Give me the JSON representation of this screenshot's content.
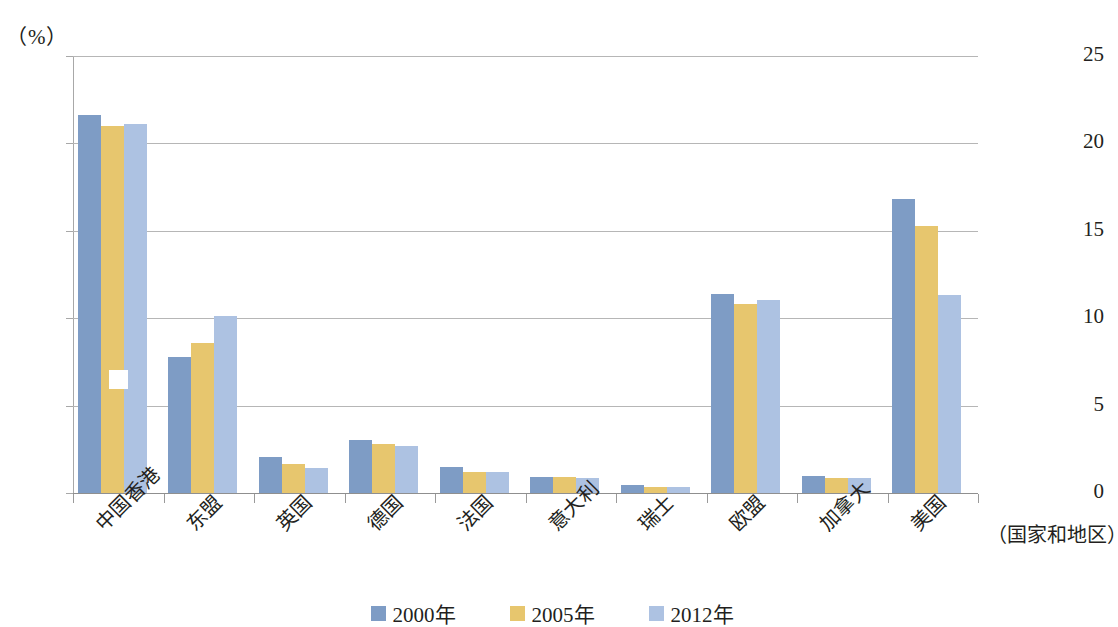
{
  "chart_data": {
    "type": "bar",
    "title": "",
    "subtitle": "",
    "unit_label": "（%）",
    "xlabel": "（国家和地区）",
    "ylabel": "",
    "ylim": [
      0,
      25
    ],
    "ytick_labels": [
      "25",
      "20",
      "15",
      "10",
      "5",
      "0"
    ],
    "ytick_values": [
      25,
      20,
      15,
      10,
      5,
      0
    ],
    "grid": true,
    "legend_position": "bottom",
    "categories": [
      "中国香港",
      "东盟",
      "英国",
      "德国",
      "法国",
      "意大利",
      "瑞士",
      "欧盟",
      "加拿大",
      "美国"
    ],
    "series": [
      {
        "name": "2000年",
        "color": "#7e9cc5",
        "values": [
          21.6,
          7.8,
          2.05,
          3.05,
          1.5,
          0.9,
          0.45,
          11.4,
          0.95,
          16.8
        ]
      },
      {
        "name": "2005年",
        "color": "#e7c66e",
        "values": [
          21.0,
          8.6,
          1.65,
          2.8,
          1.2,
          0.9,
          0.35,
          10.8,
          0.85,
          15.3
        ]
      },
      {
        "name": "2012年",
        "color": "#adc2e2",
        "values": [
          21.1,
          10.1,
          1.45,
          2.7,
          1.2,
          0.85,
          0.35,
          11.05,
          0.85,
          11.3
        ]
      }
    ]
  },
  "colors": {
    "series_2000": "#7e9cc5",
    "series_2005": "#e7c66e",
    "series_2012": "#adc2e2",
    "gridline": "#b6b6b6",
    "axis": "#a8a8a8",
    "text": "#231f20",
    "background": "#ffffff"
  }
}
